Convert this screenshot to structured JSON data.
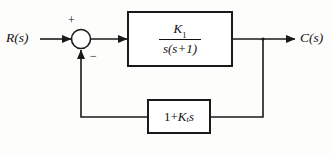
{
  "diagram": {
    "type": "control-system-block-diagram",
    "input_label": "R(s)",
    "output_label": "C(s)",
    "summing_junction": {
      "name": "summing-junction",
      "positive_sign": "+",
      "negative_sign": "−",
      "positive_input": "R(s)",
      "negative_input": "feedback"
    },
    "forward_block": {
      "name": "forward-transfer-function",
      "numerator": "K",
      "numerator_subscript": "1",
      "denominator": "s(s+1)",
      "expression": "K₁/(s(s+1))"
    },
    "feedback_block": {
      "name": "feedback-transfer-function",
      "expression": "1+Kₜs",
      "prefix": "1+",
      "gain": "K",
      "gain_subscript": "t",
      "suffix": "s"
    },
    "colors": {
      "line": "#1a1a1a",
      "block_border": "#1a1a1a",
      "background": "#fdfdfc",
      "text": "#111111"
    }
  }
}
